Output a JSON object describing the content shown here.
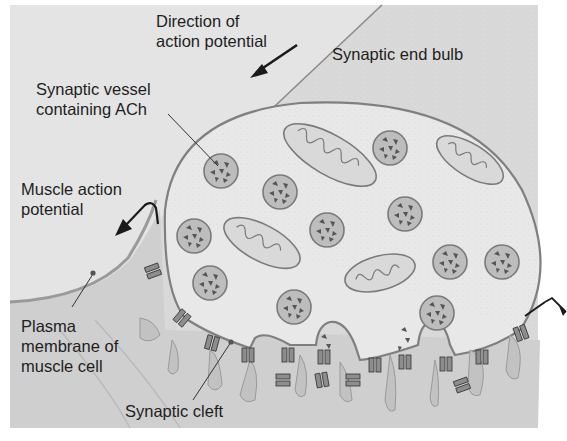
{
  "figure": {
    "type": "neuromuscular junction cross-section diagram",
    "colors": {
      "background": "#d8d8d8",
      "muscle": "#c9c9c9",
      "bulb_fill": "#e6e6e6",
      "membrane": "#8a8a8a",
      "vesicle_fill": "#bdbdbd",
      "text": "#1e1e1e",
      "arrow": "#1a1a1a"
    }
  },
  "labels": {
    "direction_of_action_potential": "Direction of\naction potential",
    "synaptic_end_bulb": "Synaptic end bulb",
    "synaptic_vesicle": "Synaptic vessel\ncontaining ACh",
    "muscle_action_potential": "Muscle action\npotential",
    "plasma_membrane": "Plasma\nmembrane of\nmuscle cell",
    "synaptic_cleft": "Synaptic cleft"
  },
  "structures": {
    "synaptic_vesicles": 14,
    "mitochondria": 4,
    "ach_receptors": 16,
    "junctional_folds": 9
  }
}
